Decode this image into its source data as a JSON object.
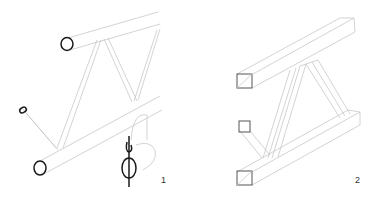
{
  "figure": {
    "panels": [
      {
        "id": "round-tube-truss",
        "label": "1",
        "description": "Truss with round tube chords and zigzag round tube web members; circular cross-section symbol (Ø) shown"
      },
      {
        "id": "square-tube-truss",
        "label": "2",
        "description": "Truss with square tube chords and diagonal square tube web members"
      }
    ],
    "symbols": {
      "diameter": "Ø"
    },
    "colors": {
      "line": "#c8c8c8",
      "section_outline": "#1a1a1a",
      "background": "#ffffff"
    }
  }
}
